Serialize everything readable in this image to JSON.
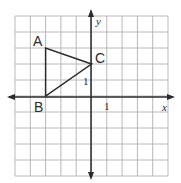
{
  "figure": {
    "grid": {
      "x_min": -5,
      "x_max": 5,
      "y_min": -5,
      "y_max": 5,
      "step": 1
    },
    "axes": {
      "x_label": "x",
      "y_label": "y",
      "x_tick_label": "1",
      "y_tick_label": "1"
    },
    "triangle": {
      "points": [
        {
          "label": "A",
          "x": -3,
          "y": 3
        },
        {
          "label": "B",
          "x": -3,
          "y": 0
        },
        {
          "label": "C",
          "x": 0,
          "y": 2
        }
      ]
    },
    "colors": {
      "grid": "#b8b8b8",
      "axis": "#2a2a2a",
      "triangle": "#2a2a2a"
    }
  }
}
